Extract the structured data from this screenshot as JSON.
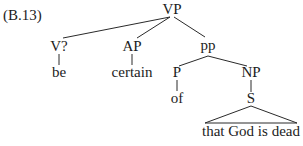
{
  "example_label": "(B.13)",
  "tree": {
    "root": "VP",
    "nodes": {
      "vp": "VP",
      "v": "V?",
      "ap": "AP",
      "pp": "pp",
      "p": "P",
      "np": "NP",
      "s": "S"
    },
    "leaves": {
      "be": "be",
      "certain": "certain",
      "of": "of",
      "clause": "that God is dead"
    },
    "structure": "[VP [V? be] [AP certain] [pp [P of] [NP [S that God is dead]]]]",
    "triangle_under": "S"
  },
  "colors": {
    "ink": "#1c1c1c",
    "background": "#ffffff"
  }
}
